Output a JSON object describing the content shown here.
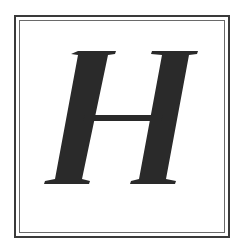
{
  "tile": {
    "letter": "H",
    "style": "italic serif",
    "colors": {
      "letter": "#2a2a2a",
      "border": "#3a3a3a",
      "background": "#ffffff"
    }
  }
}
